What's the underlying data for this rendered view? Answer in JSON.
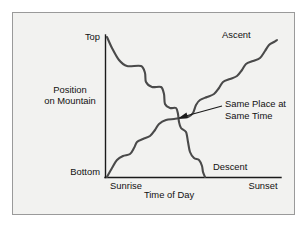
{
  "figure": {
    "background_color": "#f2f2f0",
    "frame_color": "#9a9a9a",
    "curve_color": "#4a4a4a",
    "axis_color": "#1a1a1a",
    "text_color": "#111111"
  },
  "chart_data": {
    "type": "line",
    "title": "",
    "subtitle": "",
    "xlabel": "Time of Day",
    "ylabel": "Position on Mountain",
    "ylabel_line1": "Position",
    "ylabel_line2": "on Mountain",
    "grid": false,
    "legend_position": "inline-endpoint-labels",
    "x_tick_labels": [
      "Sunrise",
      "Sunset"
    ],
    "y_tick_labels": [
      "Bottom",
      "Top"
    ],
    "xlim": [
      "Sunrise",
      "Sunset"
    ],
    "ylim": [
      "Bottom",
      "Top"
    ],
    "annotations": [
      {
        "name": "crossing-annotation",
        "text_line1": "Same Place at",
        "text_line2": "Same Time",
        "points_to_x": 178,
        "points_to_y": 118
      }
    ],
    "series": [
      {
        "name": "Descent",
        "label": "Descent",
        "description": "Hiker starts at the Top at Sunrise and steps down the mountain, reaching the Bottom before Sunset.",
        "start": {
          "x": "Sunrise",
          "y": "Top"
        },
        "end": {
          "x": "before Sunset",
          "y": "Bottom"
        },
        "points": [
          [
            107,
            37
          ],
          [
            112,
            48
          ],
          [
            119,
            60
          ],
          [
            127,
            66
          ],
          [
            141,
            66
          ],
          [
            145,
            73
          ],
          [
            146,
            82
          ],
          [
            152,
            87
          ],
          [
            161,
            87
          ],
          [
            164,
            94
          ],
          [
            165,
            104
          ],
          [
            170,
            108
          ],
          [
            176,
            108
          ],
          [
            178,
            114
          ],
          [
            179,
            122
          ],
          [
            181,
            128
          ],
          [
            186,
            132
          ],
          [
            188,
            142
          ],
          [
            190,
            152
          ],
          [
            194,
            158
          ],
          [
            199,
            160
          ],
          [
            202,
            166
          ],
          [
            203,
            172
          ],
          [
            205,
            177
          ]
        ]
      },
      {
        "name": "Ascent",
        "label": "Ascent",
        "description": "Hiker starts at the Bottom at Sunrise and climbs, reaching high on the mountain by Sunset.",
        "start": {
          "x": "Sunrise",
          "y": "Bottom"
        },
        "end": {
          "x": "Sunset",
          "y": "near Top"
        },
        "points": [
          [
            107,
            177
          ],
          [
            112,
            168
          ],
          [
            117,
            160
          ],
          [
            123,
            156
          ],
          [
            130,
            154
          ],
          [
            134,
            148
          ],
          [
            137,
            142
          ],
          [
            143,
            139
          ],
          [
            150,
            136
          ],
          [
            155,
            130
          ],
          [
            159,
            124
          ],
          [
            166,
            120
          ],
          [
            174,
            119
          ],
          [
            180,
            118
          ],
          [
            188,
            117
          ],
          [
            193,
            113
          ],
          [
            196,
            105
          ],
          [
            200,
            100
          ],
          [
            207,
            97
          ],
          [
            214,
            94
          ],
          [
            219,
            88
          ],
          [
            223,
            82
          ],
          [
            230,
            79
          ],
          [
            237,
            76
          ],
          [
            242,
            70
          ],
          [
            246,
            64
          ],
          [
            253,
            61
          ],
          [
            260,
            58
          ],
          [
            265,
            51
          ],
          [
            269,
            45
          ],
          [
            274,
            42
          ],
          [
            277,
            40
          ]
        ]
      }
    ],
    "crossing_point": {
      "x": 178,
      "y": 118,
      "meaning": "Same Place at Same Time"
    }
  },
  "labels": {
    "top": "Top",
    "bottom": "Bottom",
    "sunrise": "Sunrise",
    "sunset": "Sunset",
    "time_of_day": "Time of Day",
    "position_line1": "Position",
    "position_line2": "on Mountain",
    "ascent": "Ascent",
    "descent": "Descent",
    "annotation_line1": "Same Place at",
    "annotation_line2": "Same Time"
  }
}
